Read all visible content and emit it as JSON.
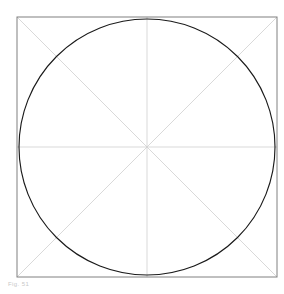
{
  "figure": {
    "caption": "Fig. 51",
    "canvas": {
      "width": 284,
      "height": 294,
      "background": "#ffffff"
    },
    "colors": {
      "ink": "#1a1a1a",
      "construction": "#cfcfcf",
      "frame": "#808080",
      "background": "#ffffff",
      "caption": "#c8c8c8"
    },
    "stroke_widths": {
      "ink": 1.15,
      "construction": 0.8,
      "frame": 1.0
    },
    "frame": {
      "name": "bounding-square",
      "x": 17,
      "y": 17,
      "width": 260,
      "height": 260
    },
    "geometry": {
      "center": {
        "x": 147,
        "y": 147
      },
      "node_offset": 72,
      "nodes": [
        {
          "name": "node-top-left",
          "x": 75,
          "y": 75
        },
        {
          "name": "node-top-right",
          "x": 219,
          "y": 75
        },
        {
          "name": "node-bottom-right",
          "x": 219,
          "y": 219
        },
        {
          "name": "node-bottom-left",
          "x": 75,
          "y": 219
        }
      ],
      "edge_points": [
        {
          "name": "edge-top",
          "x": 147,
          "y": 17
        },
        {
          "name": "edge-right",
          "x": 277,
          "y": 147
        },
        {
          "name": "edge-bottom",
          "x": 147,
          "y": 277
        },
        {
          "name": "edge-left",
          "x": 17,
          "y": 147
        }
      ],
      "main_circle": {
        "cx": 147,
        "cy": 147,
        "r": 128
      },
      "node_circle": {
        "cx": 147,
        "cy": 147,
        "r": 101.8
      },
      "quarter_circles_r": 72,
      "petal_count": 8,
      "edge_lens_count": 4
    },
    "construction_lines": [
      {
        "name": "diagonal-tl-br",
        "x1": 17,
        "y1": 17,
        "x2": 277,
        "y2": 277
      },
      {
        "name": "diagonal-tr-bl",
        "x1": 277,
        "y1": 17,
        "x2": 17,
        "y2": 277
      },
      {
        "name": "axis-horizontal",
        "x1": 17,
        "y1": 147,
        "x2": 277,
        "y2": 147
      },
      {
        "name": "axis-vertical",
        "x1": 147,
        "y1": 17,
        "x2": 147,
        "y2": 277
      }
    ]
  }
}
